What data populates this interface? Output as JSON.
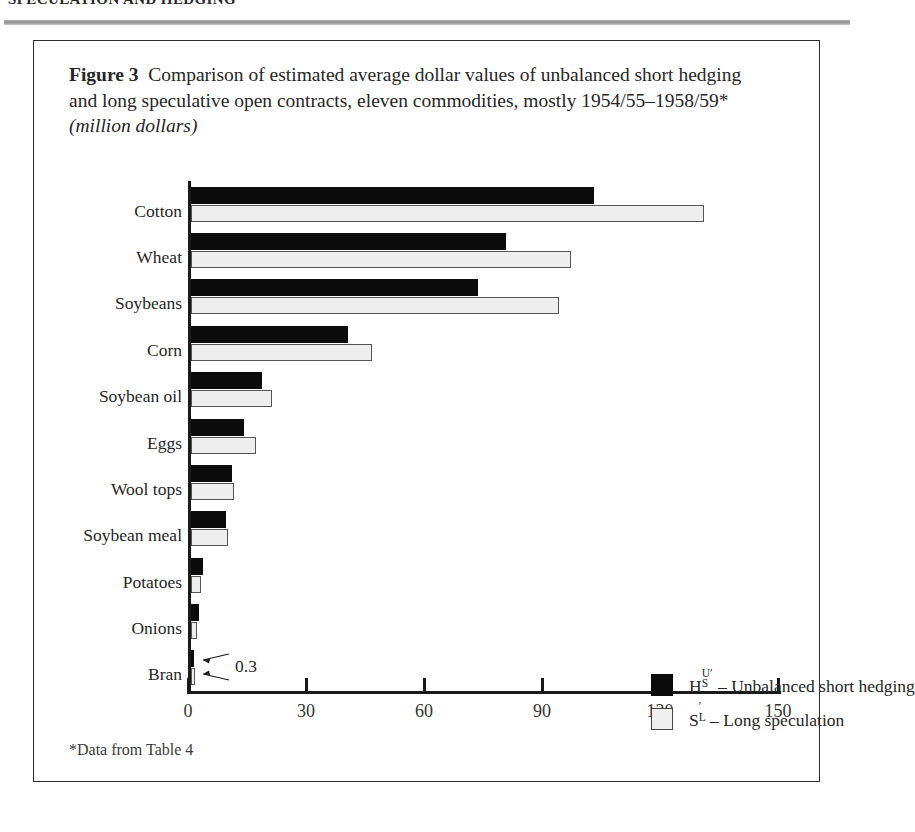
{
  "page": {
    "running_head": "SPECULATION AND HEDGING",
    "footnote": "*Data from Table 4"
  },
  "caption": {
    "figure_label": "Figure",
    "figure_number": "3",
    "text": "Comparison of estimated average dollar values of unbalanced short hedging and long speculative open contracts, eleven commodities, mostly 1954/55–1958/59*",
    "units": "(million dollars)"
  },
  "legend": {
    "position": "inside-right-middle",
    "entries": [
      {
        "symbol_main": "H",
        "symbol_sub": "S",
        "symbol_sup": "U′",
        "label": "– Unbalanced short hedging",
        "swatch": "dark",
        "color": "#0b0b0b"
      },
      {
        "symbol_main": "S",
        "symbol_sub": "L",
        "symbol_sup": "′",
        "label": "– Long speculation",
        "swatch": "light",
        "color": "#eeeeee"
      }
    ]
  },
  "annotations": [
    {
      "name": "bran-value",
      "text": "0.3",
      "target": "Bran"
    }
  ],
  "chart_data": {
    "type": "bar",
    "orientation": "horizontal",
    "title": "Comparison of estimated average dollar values of unbalanced short hedging and long speculative open contracts, eleven commodities, mostly 1954/55–1958/59",
    "xlabel": "",
    "ylabel": "",
    "units": "million dollars",
    "xlim": [
      0,
      150
    ],
    "xticks": [
      0,
      30,
      60,
      90,
      120,
      150
    ],
    "xtick_labels": [
      "0",
      "30",
      "60",
      "90",
      "120",
      "150"
    ],
    "grid": false,
    "categories": [
      "Cotton",
      "Wheat",
      "Soybeans",
      "Corn",
      "Soybean oil",
      "Eggs",
      "Wool tops",
      "Soybean meal",
      "Potatoes",
      "Onions",
      "Bran"
    ],
    "series": [
      {
        "name": "H_S^U′ – Unbalanced short hedging",
        "key": "unbalanced_short_hedging",
        "color": "#0b0b0b",
        "values": [
          102.5,
          80,
          73,
          40,
          18,
          13.5,
          10.5,
          9,
          3,
          2,
          0.3
        ]
      },
      {
        "name": "S_L′ – Long speculation",
        "key": "long_speculation",
        "color": "#eeeeee",
        "values": [
          130.5,
          96.5,
          93.5,
          46,
          20.5,
          16.5,
          11,
          9.5,
          2.5,
          1.5,
          0.3
        ]
      }
    ]
  }
}
